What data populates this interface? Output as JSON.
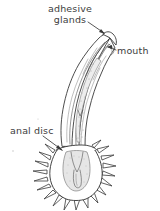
{
  "figure": {
    "kind": "biological-line-drawing",
    "background_color": "#ffffff",
    "ink_color": "#3a3a3a",
    "label_text_color": "#3d3d3d",
    "width": 160,
    "height": 211
  },
  "labels": [
    {
      "id": "adhesive-glands",
      "line1": "adhesive",
      "line2": "glands",
      "full_text": "adhesive glands",
      "position": "top-center",
      "leader": "arrow pointing down-right to anterior tip"
    },
    {
      "id": "mouth",
      "text": "mouth",
      "position": "right",
      "leader": "short horizontal line pointing left to head aperture"
    },
    {
      "id": "anal-disc",
      "text": "anal disc",
      "position": "left",
      "leader": "arrow pointing down-right to spiny basal disc"
    }
  ],
  "anatomy": {
    "head": "curved anterior proboscis bent toward the upper right",
    "body": "elongate wavy trunk with longitudinal internal bands",
    "gut": "stippled median gut running the length of the trunk",
    "base": "rounded spiny anal disc at the posterior end",
    "spine_count": 24
  }
}
